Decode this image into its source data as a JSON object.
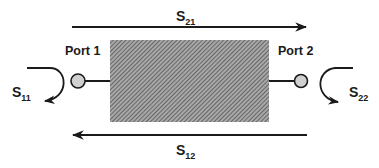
{
  "diagram": {
    "type": "two-port network S-parameters",
    "ports": [
      {
        "label": "Port 1",
        "reflection": {
          "main": "S",
          "sub": "11"
        }
      },
      {
        "label": "Port 2",
        "reflection": {
          "main": "S",
          "sub": "22"
        }
      }
    ],
    "transmission": [
      {
        "main": "S",
        "sub": "21",
        "direction": "port1-to-port2"
      },
      {
        "main": "S",
        "sub": "12",
        "direction": "port2-to-port1"
      }
    ],
    "colors": {
      "line": "#1a1a1a",
      "box_fill": "#8a8a8a",
      "port_fill": "#d0d0d0"
    }
  }
}
